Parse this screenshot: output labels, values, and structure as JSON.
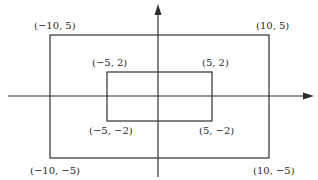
{
  "diagram": {
    "type": "coordinate-plane-rectangles",
    "colors": {
      "line": "#2f2f2f",
      "text": "#2a2a2a",
      "background": "#ffffff"
    },
    "axes": {
      "x_axis": {
        "direction": "right",
        "arrow": true
      },
      "y_axis": {
        "direction": "up",
        "arrow": true
      }
    },
    "outer_rectangle": {
      "corners": {
        "top_left": {
          "x": -10,
          "y": 5,
          "label": "(−10, 5)"
        },
        "top_right": {
          "x": 10,
          "y": 5,
          "label": "(10, 5)"
        },
        "bottom_left": {
          "x": -10,
          "y": -5,
          "label": "(−10, −5)"
        },
        "bottom_right": {
          "x": 10,
          "y": -5,
          "label": "(10, −5)"
        }
      }
    },
    "inner_rectangle": {
      "corners": {
        "top_left": {
          "x": -5,
          "y": 2,
          "label": "(−5, 2)"
        },
        "top_right": {
          "x": 5,
          "y": 2,
          "label": "(5, 2)"
        },
        "bottom_left": {
          "x": -5,
          "y": -2,
          "label": "(−5, −2)"
        },
        "bottom_right": {
          "x": 5,
          "y": -2,
          "label": "(5, −2)"
        }
      }
    }
  }
}
